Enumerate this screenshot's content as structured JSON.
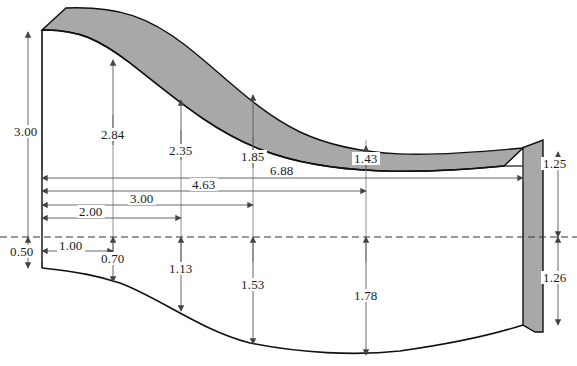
{
  "drawing": {
    "title": "Airfoil / blade cross-section dimensioned profile",
    "colors": {
      "outline": "#111111",
      "shaded_fill": "#a8a8a8",
      "dimension_line": "#555555",
      "centerline": "#333333",
      "background": "#ffffff",
      "text": "#1a1a1a"
    },
    "vertical_dimensions_upper": [
      {
        "name": "3.00",
        "value": "3.00",
        "x": 42,
        "label_x": 16,
        "label_y": 131
      },
      {
        "name": "2.84",
        "value": "2.84",
        "x": 113,
        "label_x": 100,
        "label_y": 134
      },
      {
        "name": "2.35",
        "value": "2.35",
        "x": 181,
        "label_x": 168,
        "label_y": 150
      },
      {
        "name": "1.85",
        "value": "1.85",
        "x": 253,
        "label_x": 240,
        "label_y": 156
      },
      {
        "name": "1.43",
        "value": "1.43",
        "x": 366,
        "label_x": 353,
        "label_y": 158
      }
    ],
    "vertical_dimensions_lower": [
      {
        "name": "0.50",
        "value": "0.50",
        "x": 42,
        "label_x": 12,
        "label_y": 251
      },
      {
        "name": "0.70",
        "value": "0.70",
        "x": 113,
        "label_x": 100,
        "label_y": 257
      },
      {
        "name": "1.13",
        "value": "1.13",
        "x": 181,
        "label_x": 168,
        "label_y": 267
      },
      {
        "name": "1.53",
        "value": "1.53",
        "x": 253,
        "label_x": 240,
        "label_y": 283
      },
      {
        "name": "1.78",
        "value": "1.78",
        "x": 366,
        "label_x": 353,
        "label_y": 294
      }
    ],
    "vertical_dimensions_right": [
      {
        "name": "1.25",
        "value": "1.25",
        "x": 558,
        "label_x": 545,
        "label_y": 162
      },
      {
        "name": "1.26",
        "value": "1.26",
        "x": 558,
        "label_x": 545,
        "label_y": 275
      }
    ],
    "horizontal_dimensions": [
      {
        "name": "6.88",
        "value": "6.88",
        "y": 178,
        "x_from": 42,
        "x_to": 523,
        "label_x": 272,
        "label_y": 166
      },
      {
        "name": "4.63",
        "value": "4.63",
        "y": 191,
        "x_from": 42,
        "x_to": 366,
        "label_x": 194,
        "label_y": 180
      },
      {
        "name": "3.00",
        "value": "3.00",
        "y": 205,
        "x_from": 42,
        "x_to": 253,
        "label_x": 131,
        "label_y": 194
      },
      {
        "name": "2.00",
        "value": "2.00",
        "y": 218,
        "x_from": 42,
        "x_to": 181,
        "label_x": 80,
        "label_y": 207
      },
      {
        "name": "1.00",
        "value": "1.00",
        "y": 251,
        "x_from": 42,
        "x_to": 113,
        "label_x": 60,
        "label_y": 245
      }
    ],
    "centerline": {
      "y": 237,
      "x_from": 0,
      "x_to": 577
    },
    "geometry": {
      "upper_surface_outer": "M 66,8 C 120,6 150,18 185,45 C 225,76 255,110 300,132 C 360,160 430,157 522,148",
      "upper_surface_inner": "M 42,30 C 78,29 100,40 130,63 C 170,94 210,130 262,150 C 330,176 420,174 504,166",
      "lower_surface": "M 42,268 C 80,272 98,276 120,283 C 160,298 200,330 250,343 C 300,353 355,356 400,351 C 450,344 495,334 523,325",
      "left_wall_x": 42,
      "left_wall_top": 30,
      "left_wall_bottom": 268,
      "band_left_x": 66,
      "band_left_top": 8,
      "right_band_outer_top": [
        543,
        140
      ],
      "right_band_outer_bottom": [
        535,
        332
      ],
      "right_band_inner_top": [
        523,
        148
      ],
      "right_band_inner_bottom": [
        523,
        325
      ]
    }
  }
}
